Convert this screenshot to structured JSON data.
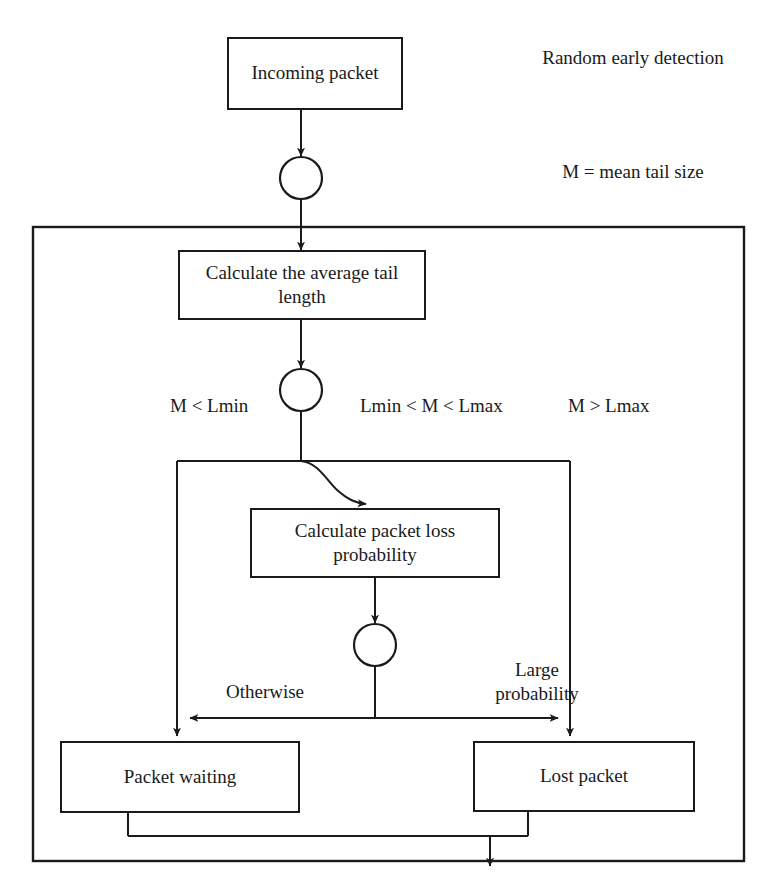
{
  "diagram": {
    "title": "Random early detection",
    "legend": "M = mean tail size",
    "nodes": {
      "incoming_packet": "Incoming packet",
      "calculate_average": "Calculate the average tail\nlength",
      "calculate_probability": "Calculate packet loss\nprobability",
      "packet_waiting": "Packet waiting",
      "lost_packet": "Lost packet"
    },
    "edge_labels": {
      "branch_low": "M < Lmin",
      "branch_mid": "Lmin < M < Lmax",
      "branch_high": "M > Lmax",
      "otherwise": "Otherwise",
      "large_probability": "Large\nprobability"
    },
    "colors": {
      "stroke": "#1a1a1a",
      "background": "#ffffff"
    }
  }
}
